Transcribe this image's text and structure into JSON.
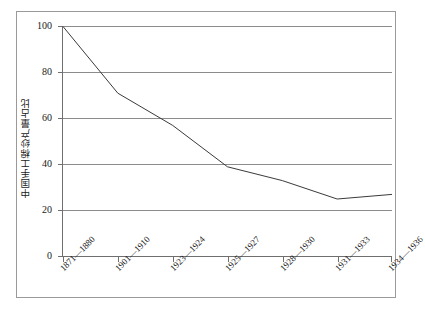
{
  "chart_data": {
    "type": "line",
    "title": "",
    "subtitle": "",
    "xlabel": "",
    "ylabel": "中国手工棉纱产量占比",
    "categories": [
      "1871—1880",
      "1901—1910",
      "1923—1924",
      "1925—1927",
      "1928—1930",
      "1931—1933",
      "1934—1936"
    ],
    "values": [
      100,
      71,
      57,
      39,
      33,
      25,
      27
    ],
    "series": [
      {
        "name": "中国手工棉纱产量占比",
        "values": [
          100,
          71,
          57,
          39,
          33,
          25,
          27
        ]
      }
    ],
    "ylim": [
      0,
      100
    ],
    "yticks": [
      0,
      20,
      40,
      60,
      80,
      100
    ],
    "ytick_labels": [
      "0",
      "20",
      "40",
      "60",
      "80",
      "100"
    ],
    "grid": "horizontal",
    "legend": "none",
    "line_color": "#3a3a3a",
    "grid_color": "#8c8c8c",
    "axis_color": "#6f6f6f",
    "frame_color": "#9a9a9a",
    "background": "#ffffff"
  },
  "axis": {
    "y_title": "中国手工棉纱产量占比"
  }
}
